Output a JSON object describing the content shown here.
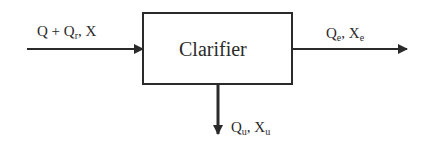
{
  "diagram": {
    "process_box": {
      "label": "Clarifier"
    },
    "inflow": {
      "label_main_1": "Q + Q",
      "label_sub_1": "r",
      "label_main_2": ", X"
    },
    "effluent": {
      "label_main_1": "Q",
      "label_sub_1": "e",
      "label_main_2": ", X",
      "label_sub_2": "e"
    },
    "underflow": {
      "label_main_1": "Q",
      "label_sub_1": "u",
      "label_main_2": ", X",
      "label_sub_2": "u"
    }
  },
  "colors": {
    "stroke": "#2a2a2a",
    "background": "#ffffff"
  }
}
